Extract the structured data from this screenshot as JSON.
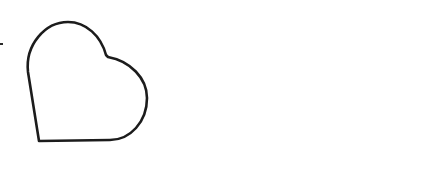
{
  "canvas": {
    "width": 424,
    "height": 195,
    "background": "#ffffff"
  },
  "shapes": [
    {
      "type": "heart-outline",
      "icon": "heart-icon",
      "fill": "none",
      "stroke": "#1c1c1c",
      "stroke_width": 2.6,
      "rotation_hint": "tilted, point at bottom-left"
    }
  ],
  "marks": [
    {
      "type": "edge-dash",
      "color": "#2a2a2a"
    }
  ]
}
